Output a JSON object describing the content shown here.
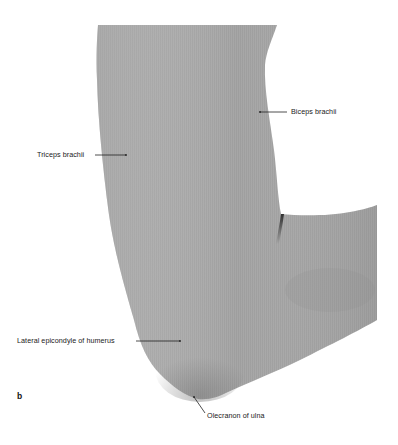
{
  "figure": {
    "panel_letter": "b",
    "colors": {
      "background": "#ffffff",
      "skin": "#a3a3a3",
      "skin_shadow": "#8e8e8e",
      "crease": "#2e2e2e",
      "label_text": "#1a1a1a",
      "leader_line": "#222222"
    },
    "labels": [
      {
        "id": "biceps-brachii",
        "text": "Biceps brachii"
      },
      {
        "id": "triceps-brachii",
        "text": "Triceps brachii"
      },
      {
        "id": "lateral-epicondyle",
        "text": "Lateral epicondyle of humerus"
      },
      {
        "id": "olecranon",
        "text": "Olecranon of ulna"
      }
    ]
  }
}
